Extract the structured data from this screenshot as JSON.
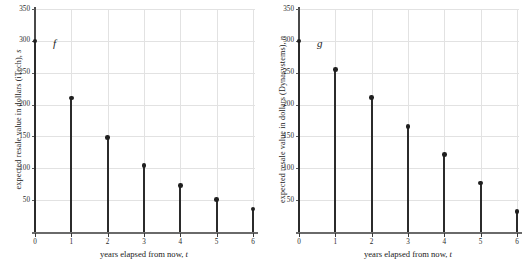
{
  "figure": {
    "panel_count": 2
  },
  "chart_data": [
    {
      "type": "scatter",
      "id": "itech-resale",
      "title": "",
      "function_label": "f",
      "xlabel": "years elapsed from now, t",
      "xlabel_text": "years elapsed from now, ",
      "xlabel_var": "t",
      "ylabel": "expected resale value in dollars (iTech), s",
      "ylabel_text": "expected resale value in dollars (iTech), ",
      "ylabel_var": "s",
      "x": [
        0,
        1,
        2,
        3,
        4,
        5,
        6
      ],
      "values": [
        300,
        210,
        148,
        104,
        73,
        51,
        36
      ],
      "xticks": [
        "0",
        "1",
        "2",
        "3",
        "4",
        "5",
        "6"
      ],
      "yticks": [
        "50",
        "100",
        "150",
        "200",
        "250",
        "300",
        "350"
      ],
      "ytick_values": [
        50,
        100,
        150,
        200,
        250,
        300,
        350
      ],
      "xlim": [
        0,
        6
      ],
      "ylim": [
        0,
        350
      ],
      "grid": "both",
      "legend": "none",
      "marker_color": "#1f1f1f",
      "stem_color": "#2b2b2b",
      "grid_color": "#e2e2e2"
    },
    {
      "type": "scatter",
      "id": "dynasystems-resale",
      "title": "",
      "function_label": "g",
      "xlabel": "years elapsed from now, t",
      "xlabel_text": "years elapsed from now, ",
      "xlabel_var": "t",
      "ylabel": "expected resale value in dollars (Dynasystems), n",
      "ylabel_text": "expected resale value in dollars (Dynasystems), ",
      "ylabel_var": "n",
      "x": [
        0,
        1,
        2,
        3,
        4,
        5,
        6
      ],
      "values": [
        300,
        255,
        211,
        166,
        122,
        77,
        32
      ],
      "xticks": [
        "0",
        "1",
        "2",
        "3",
        "4",
        "5",
        "6"
      ],
      "yticks": [
        "50",
        "100",
        "150",
        "200",
        "250",
        "300",
        "350"
      ],
      "ytick_values": [
        50,
        100,
        150,
        200,
        250,
        300,
        350
      ],
      "xlim": [
        0,
        6
      ],
      "ylim": [
        0,
        350
      ],
      "grid": "both",
      "legend": "none",
      "marker_color": "#1f1f1f",
      "stem_color": "#2b2b2b",
      "grid_color": "#e2e2e2"
    }
  ]
}
